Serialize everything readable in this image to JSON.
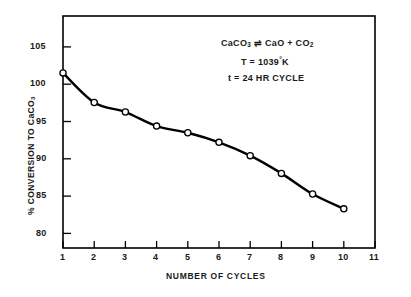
{
  "chart_data": {
    "type": "line",
    "title": "",
    "xlabel": "NUMBER OF CYCLES",
    "ylabel": "% CONVERSION TO CaCO3",
    "ylabel_display": "% CONVERSION TO CaCO",
    "ylabel_sub": "3",
    "x": [
      1,
      2,
      3,
      4,
      5,
      6,
      7,
      8,
      9,
      10
    ],
    "values": [
      100.5,
      96.5,
      95.2,
      93.3,
      92.4,
      91.1,
      89.3,
      86.9,
      84.1,
      82.1
    ],
    "series": [
      {
        "name": "% conversion to CaCO3",
        "values": [
          100.5,
          96.5,
          95.2,
          93.3,
          92.4,
          91.1,
          89.3,
          86.9,
          84.1,
          82.1
        ]
      }
    ],
    "xlim": [
      1,
      11
    ],
    "ylim": [
      76.8,
      108.2
    ],
    "xticks": [
      1,
      2,
      3,
      4,
      5,
      6,
      7,
      8,
      9,
      10,
      11
    ],
    "xtick_labels": [
      "1",
      "2",
      "3",
      "4",
      "5",
      "6",
      "7",
      "8",
      "9",
      "10",
      "11"
    ],
    "yticks": [
      80,
      85,
      90,
      95,
      100,
      105
    ],
    "ytick_labels": [
      "80",
      "85",
      "90",
      "95",
      "100",
      "105"
    ],
    "grid": false,
    "legend": "none",
    "marker": "open-circle",
    "line_color": "#000000",
    "marker_fill": "#ffffff",
    "marker_edge": "#000000",
    "axis_color": "#000000"
  },
  "annotation": {
    "line1_prefix": "CaCO",
    "line1_sub1": "3",
    "line1_mid": " ⇌ CaO + CO",
    "line1_sub2": "2",
    "line1_plain": "CaCO3 ⇌ CaO + CO2",
    "line2_prefix": "T = 1039",
    "line2_sup": "°",
    "line2_suffix": "K",
    "line2_plain": "T = 1039°K",
    "line3": "t  = 24 HR CYCLE"
  }
}
